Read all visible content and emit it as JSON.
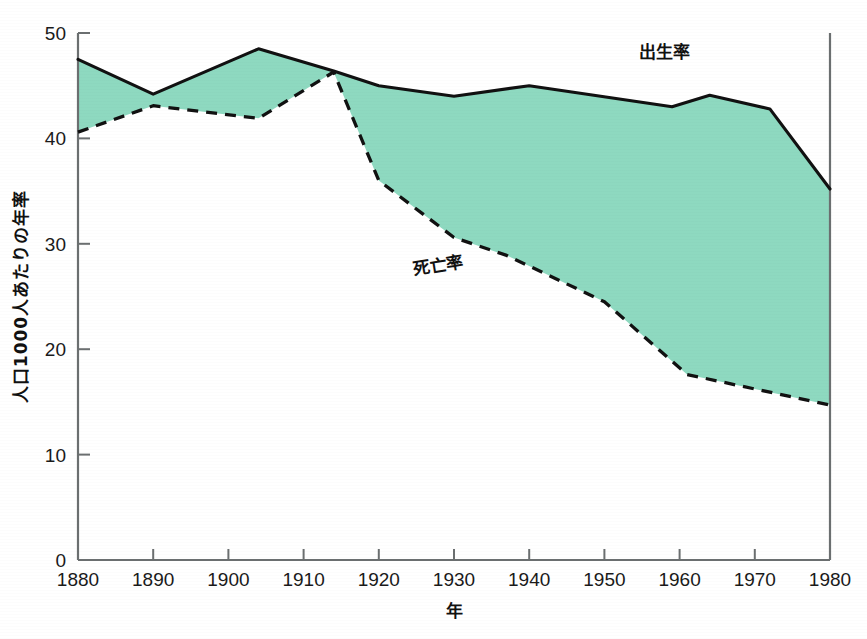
{
  "chart_data": {
    "type": "area",
    "title": "",
    "subtitle": "",
    "xlabel": "年",
    "ylabel": "人口1000人あたりの年率",
    "xlim": [
      1880,
      1980
    ],
    "ylim": [
      0,
      50
    ],
    "grid": false,
    "legend_position": "inline-annotation",
    "xticks": [
      "1880",
      "1890",
      "1900",
      "1910",
      "1920",
      "1930",
      "1940",
      "1950",
      "1960",
      "1970",
      "1980"
    ],
    "xtick_values": [
      1880,
      1890,
      1900,
      1910,
      1920,
      1930,
      1940,
      1950,
      1960,
      1970,
      1980
    ],
    "yticks": [
      "0",
      "10",
      "20",
      "30",
      "40",
      "50"
    ],
    "ytick_values": [
      0,
      10,
      20,
      30,
      40,
      50
    ],
    "fill_color": "#8ed9c0",
    "fill_label": "自然増加",
    "series": [
      {
        "name": "出生率",
        "style": "solid",
        "color": "#111111",
        "x": [
          1880,
          1890,
          1904,
          1914,
          1920,
          1930,
          1940,
          1959,
          1964,
          1972,
          1980
        ],
        "values": [
          47.5,
          44.2,
          48.5,
          46.4,
          45.0,
          44.0,
          45.0,
          43.0,
          44.1,
          42.8,
          35.2
        ],
        "annotation": "出生率"
      },
      {
        "name": "死亡率",
        "style": "dashed",
        "color": "#111111",
        "x": [
          1880,
          1890,
          1904,
          1914,
          1920,
          1930,
          1937,
          1950,
          1961,
          1980
        ],
        "values": [
          40.6,
          43.1,
          41.9,
          46.3,
          36.0,
          30.6,
          28.9,
          24.5,
          17.6,
          14.7
        ],
        "annotation": "死亡率"
      }
    ],
    "annotations": [
      {
        "text": "出生率",
        "x": 1958,
        "y": 47.6
      },
      {
        "text": "死亡率",
        "x": 1928,
        "y": 27.4
      }
    ]
  },
  "axes": {
    "y_axis_title": "人口1000人あたりの年率",
    "x_axis_title": "年"
  }
}
